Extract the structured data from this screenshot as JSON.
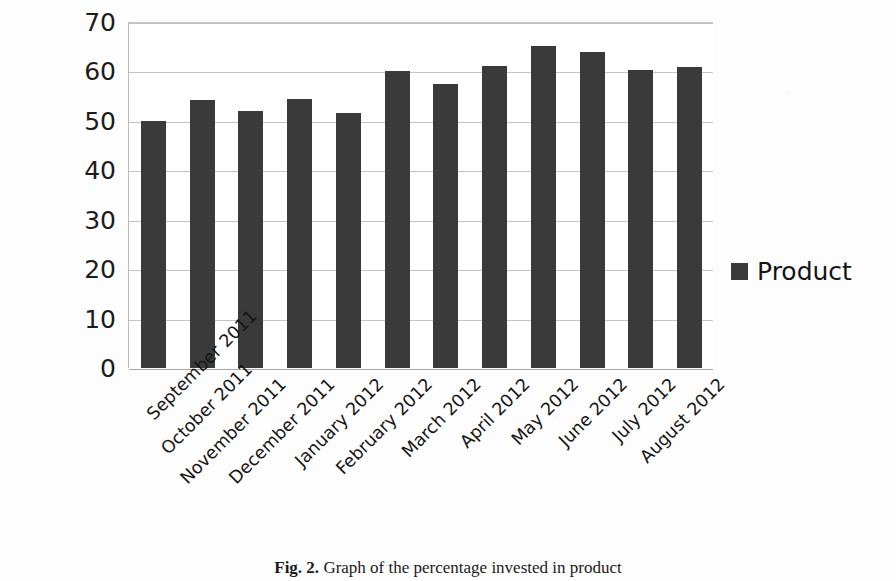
{
  "chart_data": {
    "type": "bar",
    "title": "",
    "xlabel": "",
    "ylabel": "",
    "ylim": [
      0,
      70
    ],
    "ytick_step": 10,
    "yticks": [
      70,
      60,
      50,
      40,
      30,
      20,
      10,
      0
    ],
    "grid": true,
    "legend_position": "right",
    "categories": [
      "September 2011",
      "October 2011",
      "November 2011",
      "December 2011",
      "January 2012",
      "February 2012",
      "March 2012",
      "April 2012",
      "May 2012",
      "June 2012",
      "July 2012",
      "August 2012"
    ],
    "series": [
      {
        "name": "Product",
        "color": "#3a3a3a",
        "values": [
          50,
          54.2,
          52,
          54.5,
          51.6,
          60,
          57.4,
          61.1,
          65.1,
          64,
          60.3,
          60.8
        ]
      }
    ]
  },
  "legend": {
    "entries": [
      {
        "label": "Product",
        "color": "#3a3a3a"
      }
    ]
  },
  "caption": {
    "figure_number": "Fig. 2.",
    "text": " Graph of the percentage invested in product"
  },
  "colors": {
    "bar": "#3a3a3a",
    "grid": "#c4c4c4",
    "axis": "#a8a8a8",
    "text": "#141414",
    "background": "#fdfdfd"
  }
}
